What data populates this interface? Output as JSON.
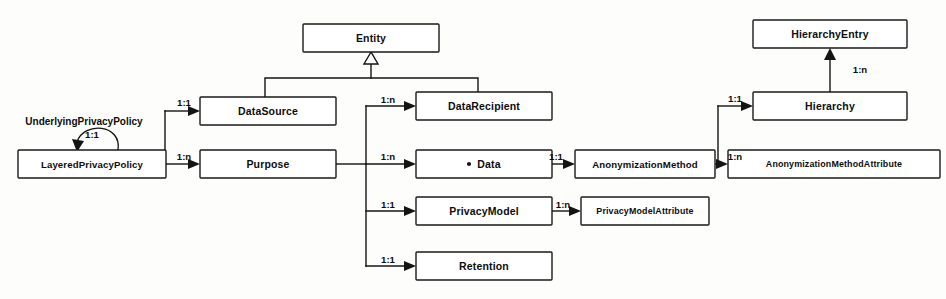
{
  "diagram": {
    "type": "uml-class-diagram",
    "background_color": "#fdfdfc",
    "line_color": "#141414",
    "box_fill": "#ffffff",
    "text_color": "#0d0d0d",
    "width": 946,
    "height": 299
  },
  "nodes": [
    {
      "id": "entity",
      "label": "Entity",
      "x": 303,
      "y": 24,
      "w": 136,
      "h": 28,
      "size": "normal"
    },
    {
      "id": "data_source",
      "label": "DataSource",
      "x": 200,
      "y": 97,
      "w": 136,
      "h": 28,
      "size": "normal"
    },
    {
      "id": "data_recipient",
      "label": "DataRecipient",
      "x": 416,
      "y": 92,
      "w": 136,
      "h": 28,
      "size": "normal"
    },
    {
      "id": "layered_privacy_policy",
      "label": "LayeredPrivacyPolicy",
      "x": 18,
      "y": 150,
      "w": 148,
      "h": 28,
      "size": "small"
    },
    {
      "id": "purpose",
      "label": "Purpose",
      "x": 200,
      "y": 150,
      "w": 136,
      "h": 28,
      "size": "normal"
    },
    {
      "id": "data",
      "label": "Data",
      "x": 416,
      "y": 150,
      "w": 136,
      "h": 28,
      "size": "normal",
      "bullet": true
    },
    {
      "id": "privacy_model",
      "label": "PrivacyModel",
      "x": 416,
      "y": 197,
      "w": 136,
      "h": 28,
      "size": "normal"
    },
    {
      "id": "retention",
      "label": "Retention",
      "x": 416,
      "y": 252,
      "w": 136,
      "h": 28,
      "size": "normal"
    },
    {
      "id": "anonymization_method",
      "label": "AnonymizationMethod",
      "x": 575,
      "y": 150,
      "w": 140,
      "h": 28,
      "size": "small"
    },
    {
      "id": "privacy_model_attribute",
      "label": "PrivacyModelAttribute",
      "x": 581,
      "y": 197,
      "w": 128,
      "h": 28,
      "size": "tiny"
    },
    {
      "id": "hierarchy_entry",
      "label": "HierarchyEntry",
      "x": 753,
      "y": 20,
      "w": 154,
      "h": 28,
      "size": "normal"
    },
    {
      "id": "hierarchy",
      "label": "Hierarchy",
      "x": 753,
      "y": 92,
      "w": 154,
      "h": 28,
      "size": "normal"
    },
    {
      "id": "anonymization_method_attr",
      "label": "AnonymizationMethodAttribute",
      "x": 728,
      "y": 150,
      "w": 212,
      "h": 28,
      "size": "tiny"
    }
  ],
  "generalization": {
    "name": "entity-generalization",
    "child_ids": [
      "data_source",
      "data_recipient"
    ],
    "parent_id": "entity"
  },
  "associations": [
    {
      "id": "lpp-self",
      "name": "self-association-underlying-privacy-policy",
      "from": "layered_privacy_policy",
      "to": "layered_privacy_policy",
      "multiplicity": "1:1",
      "label": "UnderlyingPrivacyPolicy",
      "mult_x": 92,
      "mult_y": 135,
      "label_x": 84,
      "label_y": 122
    },
    {
      "id": "lpp-datasource",
      "name": "assoc-layeredprivacypolicy-datasource",
      "from": "layered_privacy_policy",
      "to": "data_source",
      "multiplicity": "1:1",
      "mult_x": 184,
      "mult_y": 103
    },
    {
      "id": "lpp-purpose",
      "name": "assoc-layeredprivacypolicy-purpose",
      "from": "layered_privacy_policy",
      "to": "purpose",
      "multiplicity": "1:n",
      "mult_x": 184,
      "mult_y": 157
    },
    {
      "id": "purpose-recip",
      "name": "assoc-purpose-datarecipient",
      "from": "purpose",
      "to": "data_recipient",
      "multiplicity": "1:n",
      "mult_x": 388,
      "mult_y": 100
    },
    {
      "id": "purpose-data",
      "name": "assoc-purpose-data",
      "from": "purpose",
      "to": "data",
      "multiplicity": "1:n",
      "mult_x": 388,
      "mult_y": 157
    },
    {
      "id": "purpose-pmodel",
      "name": "assoc-purpose-privacymodel",
      "from": "purpose",
      "to": "privacy_model",
      "multiplicity": "1:1",
      "mult_x": 388,
      "mult_y": 205
    },
    {
      "id": "purpose-retent",
      "name": "assoc-purpose-retention",
      "from": "purpose",
      "to": "retention",
      "multiplicity": "1:1",
      "mult_x": 388,
      "mult_y": 260
    },
    {
      "id": "data-anon",
      "name": "assoc-data-anonymizationmethod",
      "from": "data",
      "to": "anonymization_method",
      "multiplicity": "1:1",
      "mult_x": 556,
      "mult_y": 157
    },
    {
      "id": "pmodel-pmattr",
      "name": "assoc-privacymodel-privacymodelattribute",
      "from": "privacy_model",
      "to": "privacy_model_attribute",
      "multiplicity": "1:n",
      "mult_x": 563,
      "mult_y": 205
    },
    {
      "id": "anon-hier",
      "name": "assoc-anonymizationmethod-hierarchy",
      "from": "anonymization_method",
      "to": "hierarchy",
      "multiplicity": "1:1",
      "mult_x": 735,
      "mult_y": 99
    },
    {
      "id": "anon-anonattr",
      "name": "assoc-anonymizationmethod-attribute",
      "from": "anonymization_method",
      "to": "anonymization_method_attr",
      "multiplicity": "1:n",
      "mult_x": 735,
      "mult_y": 157
    },
    {
      "id": "hier-hierentry",
      "name": "assoc-hierarchy-hierarchyentry",
      "from": "hierarchy",
      "to": "hierarchy_entry",
      "multiplicity": "1:n",
      "mult_x": 860,
      "mult_y": 70
    }
  ]
}
